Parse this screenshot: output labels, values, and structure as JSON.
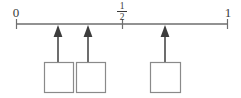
{
  "figure": {
    "type": "number-line-exercise",
    "title": "",
    "axis": {
      "start_label": "0",
      "mid_label_numerator": "1",
      "mid_label_denominator": "2",
      "end_label": "1",
      "start_value": 0,
      "mid_value": 0.5,
      "end_value": 1,
      "line_color": "#6e6e6e",
      "line_y": 24,
      "x_start": 16,
      "x_end": 228
    },
    "ticks": [
      {
        "name": "tick-0",
        "label": "0",
        "x": 16,
        "value": 0
      },
      {
        "name": "tick-one-half",
        "label": "1/2",
        "x": 122,
        "value": 0.5
      },
      {
        "name": "tick-1",
        "label": "1",
        "x": 228,
        "value": 1
      }
    ],
    "pointers": [
      {
        "name": "pointer-1",
        "x": 58,
        "value": 0.198,
        "arrow_top_y": 26,
        "arrow_bottom_y": 62
      },
      {
        "name": "pointer-2",
        "x": 88,
        "value": 0.34,
        "arrow_top_y": 26,
        "arrow_bottom_y": 62
      },
      {
        "name": "pointer-3",
        "x": 165,
        "value": 0.703,
        "arrow_top_y": 26,
        "arrow_bottom_y": 62
      }
    ],
    "answer_boxes": [
      {
        "name": "answer-box-1",
        "value": "",
        "x": 44,
        "y": 62,
        "width": 29,
        "height": 31
      },
      {
        "name": "answer-box-2",
        "value": "",
        "x": 76,
        "y": 62,
        "width": 29,
        "height": 31
      },
      {
        "name": "answer-box-3",
        "value": "",
        "x": 150,
        "y": 62,
        "width": 30,
        "height": 31
      }
    ],
    "colors": {
      "line": "#6e6e6e",
      "arrow": "#3d3d3d",
      "box_border": "#8a8a8a",
      "box_fill": "#ffffff",
      "text": "#3a3a3a",
      "background": "#ffffff"
    }
  }
}
